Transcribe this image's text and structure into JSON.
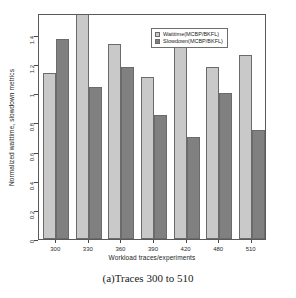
{
  "caption": "(a)Traces 300 to 510",
  "legend": {
    "position": "top-center",
    "entries": [
      {
        "label": "Waittime(MCBP/BKFL)",
        "color": "#c9c9c9",
        "key": "waittime"
      },
      {
        "label": "Slowdown(MCBP/BKFL)",
        "color": "#808080",
        "key": "slowdown"
      }
    ]
  },
  "axes": {
    "ylabel": "Normalized waittime, slowdown metrics",
    "xlabel": "Workload traces/experiments",
    "yticks": [
      "0",
      "0.2",
      "0.4",
      "0.6",
      "0.8",
      "1",
      "1.2",
      "1.4"
    ],
    "ytick_values": [
      0,
      0.2,
      0.4,
      0.6,
      0.8,
      1.0,
      1.2,
      1.4
    ]
  },
  "chart_data": {
    "type": "bar",
    "title": "",
    "xlabel": "Workload traces/experiments",
    "ylabel": "Normalized waittime, slowdown metrics",
    "categories": [
      "300",
      "330",
      "360",
      "390",
      "420",
      "480",
      "510"
    ],
    "series": [
      {
        "name": "Waittime(MCBP/BKFL)",
        "color": "#c9c9c9",
        "values": [
          1.14,
          1.55,
          1.34,
          1.11,
          1.43,
          1.18,
          1.26
        ]
      },
      {
        "name": "Slowdown(MCBP/BKFL)",
        "color": "#808080",
        "values": [
          1.37,
          1.04,
          1.18,
          0.85,
          0.7,
          1.0,
          0.75
        ]
      }
    ],
    "ylim": [
      0,
      1.55
    ],
    "grid": false,
    "legend_position": "top-center"
  }
}
